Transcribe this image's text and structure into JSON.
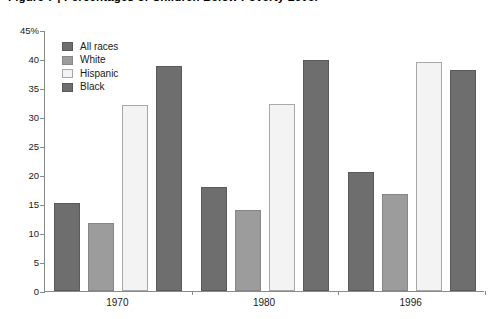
{
  "chart_data": {
    "type": "bar",
    "title": "Figure 7 | Percentages of Children Below Poverty Level",
    "xlabel": "",
    "ylabel": "",
    "categories": [
      "1970",
      "1980",
      "1996"
    ],
    "series": [
      {
        "name": "All races",
        "color": "#6e6e6e",
        "values": [
          15.1,
          18.0,
          20.5
        ]
      },
      {
        "name": "White",
        "color": "#9c9c9c",
        "values": [
          11.8,
          14.0,
          16.8
        ]
      },
      {
        "name": "Hispanic",
        "color": "#f3f3f3",
        "values": [
          32.0,
          32.2,
          39.5
        ]
      },
      {
        "name": "Black",
        "color": "#6e6e6e",
        "values": [
          38.8,
          39.8,
          38.1
        ]
      }
    ],
    "ylim": [
      0,
      45
    ],
    "yticks": [
      0,
      5,
      10,
      15,
      20,
      25,
      30,
      35,
      40,
      45
    ],
    "ytick_labels": [
      "0",
      "5",
      "10",
      "15",
      "20",
      "25",
      "30",
      "35",
      "40",
      "45%"
    ],
    "grid": false,
    "legend_position": "top-left"
  }
}
